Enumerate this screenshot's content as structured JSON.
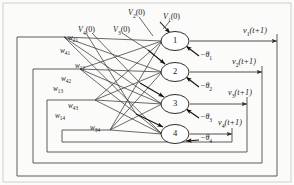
{
  "figure": {
    "type": "recurrent-neural-network-diagram",
    "title": "",
    "background_color": "#fbfbfa",
    "line_color": "#3a3a3a",
    "text_color": "#1a1a1a"
  },
  "neurons": [
    {
      "label": "1",
      "cx": 175,
      "cy": 41
    },
    {
      "label": "2",
      "cx": 175,
      "cy": 72
    },
    {
      "label": "3",
      "cx": 175,
      "cy": 104
    },
    {
      "label": "4",
      "cx": 175,
      "cy": 134
    }
  ],
  "inputs": [
    {
      "base": "V",
      "index": "4",
      "arg": "(0)",
      "x": 78,
      "y": 25
    },
    {
      "base": "V",
      "index": "3",
      "arg": "(0)",
      "x": 113,
      "y": 25
    },
    {
      "base": "V",
      "index": "2",
      "arg": "(0)",
      "x": 128,
      "y": 8
    },
    {
      "base": "V",
      "index": "1",
      "arg": "(0)",
      "x": 163,
      "y": 12
    }
  ],
  "outputs": [
    {
      "base": "v",
      "index": "1",
      "arg": "(t+1)",
      "x": 243,
      "y": 26
    },
    {
      "base": "v",
      "index": "2",
      "arg": "(t+1)",
      "x": 232,
      "y": 57
    },
    {
      "base": "v",
      "index": "3",
      "arg": "(t+1)",
      "x": 228,
      "y": 88
    },
    {
      "base": "v",
      "index": "4",
      "arg": "(t+1)",
      "x": 218,
      "y": 118
    }
  ],
  "thresholds": [
    {
      "text": "−θ",
      "index": "1",
      "x": 200,
      "y": 55
    },
    {
      "text": "−θ",
      "index": "2",
      "x": 200,
      "y": 86
    },
    {
      "text": "−θ",
      "index": "3",
      "x": 200,
      "y": 117
    },
    {
      "text": "−θ",
      "index": "4",
      "x": 200,
      "y": 135
    }
  ],
  "weights": [
    {
      "base": "w",
      "index": "21",
      "x": 68,
      "y": 34
    },
    {
      "base": "w",
      "index": "41",
      "x": 60,
      "y": 47
    },
    {
      "base": "w",
      "index": "12",
      "x": 75,
      "y": 62
    },
    {
      "base": "w",
      "index": "42",
      "x": 61,
      "y": 75
    },
    {
      "base": "w",
      "index": "13",
      "x": 53,
      "y": 85
    },
    {
      "base": "w",
      "index": "43",
      "x": 68,
      "y": 102
    },
    {
      "base": "w",
      "index": "14",
      "x": 55,
      "y": 112
    },
    {
      "base": "w",
      "index": "34",
      "x": 90,
      "y": 124
    }
  ],
  "feedback_loops": [
    {
      "name": "loop-1",
      "left": 17,
      "top": 37,
      "right": 277,
      "bottom": 176
    },
    {
      "name": "loop-2",
      "left": 33,
      "top": 69,
      "right": 262,
      "bottom": 163
    },
    {
      "name": "loop-3",
      "left": 47,
      "top": 100,
      "right": 247,
      "bottom": 152
    },
    {
      "name": "loop-4",
      "left": 62,
      "top": 130,
      "right": 232,
      "bottom": 142
    }
  ],
  "connection_fan_origins": [
    {
      "name": "fan-origin-1",
      "x": 64,
      "y": 37
    },
    {
      "name": "fan-origin-2",
      "x": 80,
      "y": 69
    },
    {
      "name": "fan-origin-3",
      "x": 95,
      "y": 100
    },
    {
      "name": "fan-origin-4",
      "x": 110,
      "y": 130
    }
  ]
}
